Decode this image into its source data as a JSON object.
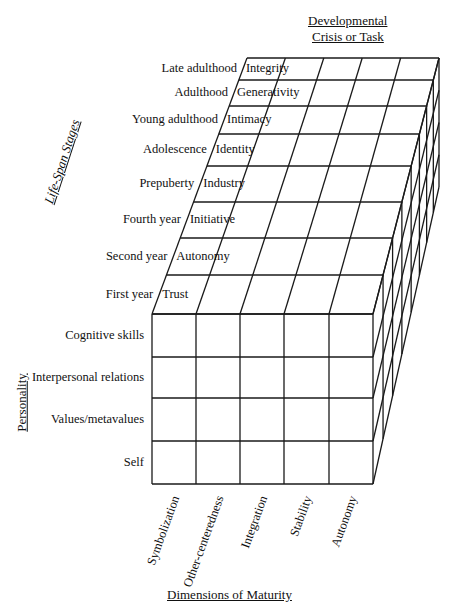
{
  "diagram": {
    "type": "3d-matrix-cube",
    "axes": {
      "depth_title": "Developmental Crisis or Task",
      "vertical_top_title": "Life-Span Stages",
      "vertical_front_title": "Personality",
      "horizontal_title": "Dimensions of Maturity"
    },
    "life_span_stages": [
      {
        "stage": "Late adulthood",
        "crisis": "Integrity"
      },
      {
        "stage": "Adulthood",
        "crisis": "Generativity"
      },
      {
        "stage": "Young adulthood",
        "crisis": "Intimacy"
      },
      {
        "stage": "Adolescence",
        "crisis": "Identity"
      },
      {
        "stage": "Prepuberty",
        "crisis": "Industry"
      },
      {
        "stage": "Fourth year",
        "crisis": "Initiative"
      },
      {
        "stage": "Second year",
        "crisis": "Autonomy"
      },
      {
        "stage": "First year",
        "crisis": "Trust"
      }
    ],
    "personality": [
      "Cognitive skills",
      "Interpersonal relations",
      "Values/metavalues",
      "Self"
    ],
    "dimensions_of_maturity": [
      "Symbolization",
      "Other-centeredness",
      "Integration",
      "Stability",
      "Autonomy"
    ]
  }
}
